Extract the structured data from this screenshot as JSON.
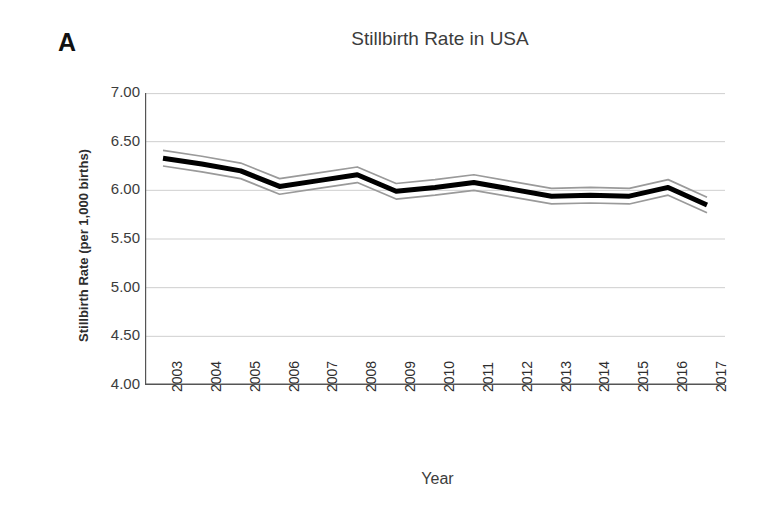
{
  "figure": {
    "panel_label": "A",
    "background_color": "#ffffff"
  },
  "chart_data": {
    "type": "line",
    "title": "Stillbirth Rate in USA",
    "xlabel": "Year",
    "ylabel": "Stillbirth Rate (per 1,000 births)",
    "categories": [
      "2003",
      "2004",
      "2005",
      "2006",
      "2007",
      "2008",
      "2009",
      "2010",
      "2011",
      "2012",
      "2013",
      "2014",
      "2015",
      "2016",
      "2017"
    ],
    "x": [
      2003,
      2004,
      2005,
      2006,
      2007,
      2008,
      2009,
      2010,
      2011,
      2012,
      2013,
      2014,
      2015,
      2016,
      2017
    ],
    "ylim": [
      4.0,
      7.0
    ],
    "ytick_labels": [
      "7.00",
      "6.50",
      "6.00",
      "5.50",
      "5.00",
      "4.50",
      "4.00"
    ],
    "ytick_values": [
      7.0,
      6.5,
      6.0,
      5.5,
      5.0,
      4.5,
      4.0
    ],
    "grid": true,
    "legend": "none",
    "series": [
      {
        "name": "Stillbirth rate",
        "color": "#000000",
        "style": "solid-thick",
        "values": [
          6.33,
          6.27,
          6.2,
          6.04,
          6.1,
          6.16,
          5.99,
          6.03,
          6.08,
          6.01,
          5.94,
          5.95,
          5.94,
          6.03,
          5.85
        ]
      },
      {
        "name": "Upper confidence limit",
        "color": "#9a9a9a",
        "style": "solid-thin",
        "values": [
          6.41,
          6.35,
          6.28,
          6.12,
          6.18,
          6.24,
          6.07,
          6.11,
          6.16,
          6.09,
          6.02,
          6.03,
          6.02,
          6.11,
          5.93
        ]
      },
      {
        "name": "Lower confidence limit",
        "color": "#9a9a9a",
        "style": "solid-thin",
        "values": [
          6.25,
          6.19,
          6.12,
          5.96,
          6.02,
          6.08,
          5.91,
          5.95,
          6.0,
          5.93,
          5.86,
          5.87,
          5.86,
          5.95,
          5.77
        ]
      }
    ]
  }
}
